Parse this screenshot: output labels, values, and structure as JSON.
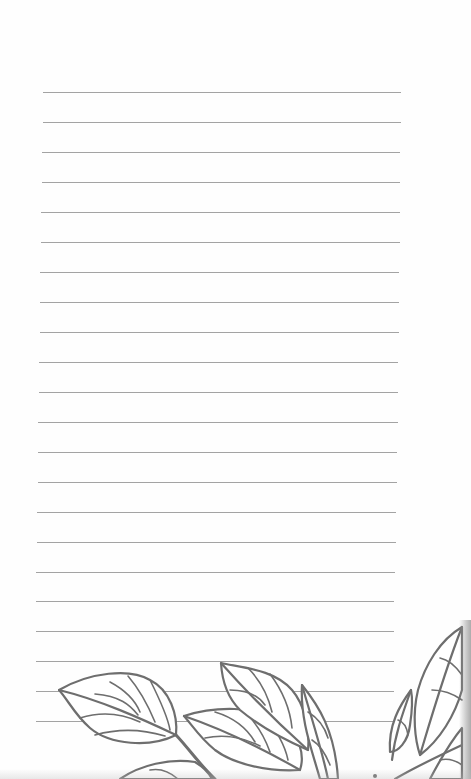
{
  "page": {
    "type": "lined-notebook-page",
    "background_color": "#fefefe",
    "line_color": "#a3a3a3",
    "leaf_stroke_color": "#6e6e6e",
    "rule_count": 22,
    "rule_spacing_px": 30,
    "first_rule_y": 92
  },
  "rules": [
    {
      "y": 92,
      "x1": 43,
      "x2": 401
    },
    {
      "y": 122,
      "x1": 43,
      "x2": 401
    },
    {
      "y": 152,
      "x1": 42,
      "x2": 400
    },
    {
      "y": 182,
      "x1": 42,
      "x2": 400
    },
    {
      "y": 212,
      "x1": 41,
      "x2": 400
    },
    {
      "y": 242,
      "x1": 41,
      "x2": 400
    },
    {
      "y": 272,
      "x1": 40,
      "x2": 399
    },
    {
      "y": 302,
      "x1": 40,
      "x2": 399
    },
    {
      "y": 332,
      "x1": 40,
      "x2": 399
    },
    {
      "y": 362,
      "x1": 39,
      "x2": 398
    },
    {
      "y": 392,
      "x1": 39,
      "x2": 398
    },
    {
      "y": 422,
      "x1": 38,
      "x2": 398
    },
    {
      "y": 452,
      "x1": 38,
      "x2": 397
    },
    {
      "y": 482,
      "x1": 38,
      "x2": 397
    },
    {
      "y": 512,
      "x1": 37,
      "x2": 396
    },
    {
      "y": 542,
      "x1": 37,
      "x2": 396
    },
    {
      "y": 572,
      "x1": 36,
      "x2": 395
    },
    {
      "y": 601,
      "x1": 36,
      "x2": 394
    },
    {
      "y": 631,
      "x1": 36,
      "x2": 394
    },
    {
      "y": 661,
      "x1": 36,
      "x2": 394
    },
    {
      "y": 691,
      "x1": 36,
      "x2": 394
    },
    {
      "y": 721,
      "x1": 36,
      "x2": 394
    }
  ],
  "illustration": {
    "subject": "leaf-branch-line-art",
    "position": "bottom"
  }
}
